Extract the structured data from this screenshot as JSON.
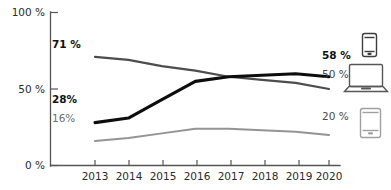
{
  "chart_data": {
    "type": "line",
    "title": "",
    "xlabel": "",
    "ylabel": "",
    "categories": [
      "2013",
      "2014",
      "2015",
      "2016",
      "2017",
      "2018",
      "2019",
      "2020"
    ],
    "x": [
      2013,
      2014,
      2015,
      2016,
      2017,
      2018,
      2019,
      2020
    ],
    "ylim": [
      0,
      100
    ],
    "xlim": [
      2013,
      2020
    ],
    "grid": false,
    "legend_position": "right",
    "y_ticks": [
      0,
      50,
      100
    ],
    "y_tick_labels": [
      "0 %",
      "50 %",
      "100 %"
    ],
    "series": [
      {
        "name": "smartphone",
        "icon": "smartphone-icon",
        "color": "#0d0d0d",
        "emphasis": "bold",
        "start_label": "28%",
        "end_label": "58 %",
        "start_value": 28,
        "end_value": 58,
        "values": [
          28,
          31,
          43,
          55,
          58,
          59,
          60,
          58
        ]
      },
      {
        "name": "laptop",
        "icon": "laptop-icon",
        "color": "#4d4d4d",
        "emphasis": "normal",
        "start_label": "71 %",
        "end_label": "50 %",
        "start_value": 71,
        "end_value": 50,
        "values": [
          71,
          69,
          65,
          62,
          58,
          56,
          54,
          50
        ]
      },
      {
        "name": "tablet",
        "icon": "tablet-icon",
        "color": "#949494",
        "emphasis": "normal",
        "start_label": "16%",
        "end_label": "20 %",
        "start_value": 16,
        "end_value": 20,
        "values": [
          16,
          18,
          21,
          24,
          24,
          23,
          22,
          20
        ]
      }
    ]
  },
  "axis": {
    "y_top": "100 %",
    "y_mid": "50 %",
    "y_bottom": "0 %",
    "x_ticks": [
      "2013",
      "2014",
      "2015",
      "2016",
      "2017",
      "2018",
      "2019",
      "2020"
    ]
  },
  "labels": {
    "laptop_start": "71 %",
    "phone_start": "28%",
    "tablet_start": "16%",
    "phone_end": "58 %",
    "laptop_end": "50 %",
    "tablet_end": "20 %"
  },
  "icons": {
    "smartphone": "smartphone-icon",
    "laptop": "laptop-icon",
    "tablet": "tablet-icon"
  }
}
